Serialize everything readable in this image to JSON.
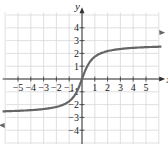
{
  "chart_data": {
    "type": "line",
    "title": "",
    "xlabel": "x",
    "ylabel": "y",
    "xlim": [
      -6,
      6
    ],
    "ylim": [
      -5,
      5
    ],
    "grid": true,
    "x_ticks": [
      "-5",
      "-4",
      "-3",
      "-2",
      "-1",
      "1",
      "2",
      "3",
      "4",
      "5"
    ],
    "y_ticks": [
      "4",
      "3",
      "2",
      "1",
      "-1",
      "-2",
      "-3",
      "-4"
    ],
    "series": [
      {
        "name": "curve",
        "x": [
          -6,
          -5,
          -4,
          -3,
          -2,
          -1,
          -0.5,
          0,
          0.5,
          1,
          2,
          3,
          4,
          5,
          6
        ],
        "y": [
          -3.6,
          -3.5,
          -3.35,
          -3.1,
          -2.6,
          -1.6,
          -0.9,
          0,
          0.9,
          1.6,
          2.6,
          3.1,
          3.35,
          3.5,
          3.6
        ]
      }
    ],
    "arrows": "both ends"
  },
  "labels": {
    "x_axis": "x",
    "y_axis": "y"
  }
}
